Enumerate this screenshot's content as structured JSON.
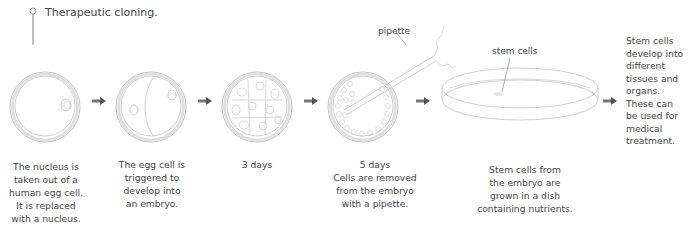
{
  "title": "Therapeutic cloning.",
  "labels": {
    "pipette": "pipette",
    "stem_cells": "stem cells"
  },
  "steps": [
    {
      "caption": [
        "The nucleus is",
        "taken out of a",
        "human egg cell.",
        "It is replaced",
        "with a nucleus."
      ]
    },
    {
      "caption": [
        "The egg cell is",
        "triggered to",
        "develop into",
        "an embryo."
      ]
    },
    {
      "caption": [
        "3 days"
      ]
    },
    {
      "caption": [
        "5 days",
        "Cells are removed",
        "from the embryo",
        "with a pipette."
      ]
    },
    {
      "caption": [
        "Stem cells from",
        "the embryo are",
        "grown in a dish",
        "containing nutrients."
      ]
    },
    {
      "caption": [
        "Stem cells",
        "develop into",
        "different",
        "tissues and",
        "organs.",
        "These can",
        "be used for",
        "medical",
        "treatment."
      ]
    }
  ],
  "colors": {
    "text": "#444444",
    "outline": "#bdbdbd",
    "arrow": "#555555",
    "pin": "#9a9a9a"
  },
  "icons": {
    "arrow": "right-arrow",
    "pin": "pin-marker"
  }
}
